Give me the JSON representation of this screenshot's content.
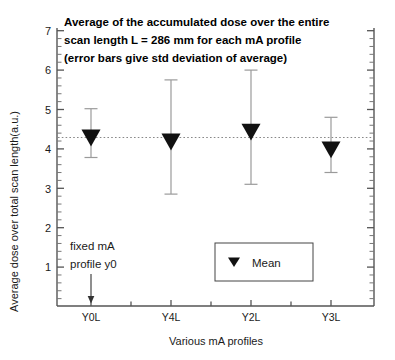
{
  "chart_data": {
    "type": "scatter",
    "title": "Average of the accumulated dose over the entire scan length L = 286 mm for each mA profile (error bars give std deviation of average)",
    "title_lines": [
      "Average of the accumulated dose over the entire",
      "scan length L = 286 mm for each mA profile",
      "(error bars give std deviation of average)"
    ],
    "xlabel": "Various mA profiles",
    "ylabel": "Average dose over total scan length(a.u.)",
    "categories": [
      "Y0L",
      "Y4L",
      "Y2L",
      "Y3L"
    ],
    "values": [
      4.4,
      4.3,
      4.55,
      4.1
    ],
    "errors": [
      0.62,
      1.45,
      1.45,
      0.7
    ],
    "series": [
      {
        "name": "Mean",
        "values": [
          4.4,
          4.3,
          4.55,
          4.1
        ],
        "errors": [
          0.62,
          1.45,
          1.45,
          0.7
        ],
        "marker": "triangle-down",
        "color": "#111111"
      }
    ],
    "ylim": [
      0,
      7
    ],
    "yticks": [
      1,
      2,
      3,
      4,
      5,
      6,
      7
    ],
    "ytick_labels": [
      "1",
      "2",
      "3",
      "4",
      "5",
      "6",
      "7"
    ],
    "y_minor_per_major": 4,
    "grid": false,
    "reference_line": {
      "value": 4.37,
      "style": "dotted",
      "color": "#888888"
    },
    "legend": {
      "position": "bottom-center-right",
      "entries": [
        {
          "label": "Mean",
          "marker": "triangle-down"
        }
      ]
    },
    "annotations": [
      {
        "text_lines": [
          "fixed mA",
          "profile y0"
        ],
        "text": "fixed mA profile y0",
        "points_to": "Y0L",
        "arrow": "down-arrow"
      }
    ]
  }
}
